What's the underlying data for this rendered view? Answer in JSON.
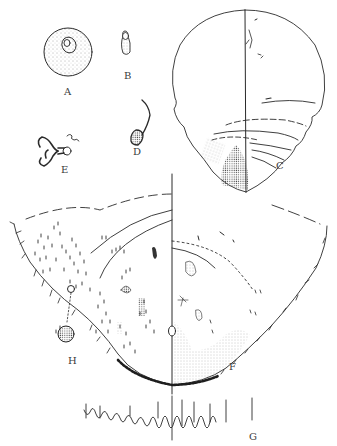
{
  "plate": {
    "description": "Scientific line-drawing plate of a scale insect with lettered figures",
    "background": "#ffffff",
    "ink_color": "#2a2a2a",
    "figures": [
      {
        "label": "A",
        "subject": "egg",
        "x": 64,
        "y": 87
      },
      {
        "label": "B",
        "subject": "small elongate body",
        "x": 124,
        "y": 71
      },
      {
        "label": "C",
        "subject": "adult female outline, halved dorsal/ventral",
        "x": 276,
        "y": 161
      },
      {
        "label": "D",
        "subject": "mouthparts with curved stylet",
        "x": 133,
        "y": 135
      },
      {
        "label": "E",
        "subject": "spiracle",
        "x": 61,
        "y": 148
      },
      {
        "label": "F",
        "subject": "posterior end, ventral half",
        "x": 229,
        "y": 362
      },
      {
        "label": "H",
        "subject": "pore detail",
        "x": 68,
        "y": 356
      },
      {
        "label": "G",
        "subject": "marginal setae row",
        "x": 249,
        "y": 432
      }
    ]
  }
}
